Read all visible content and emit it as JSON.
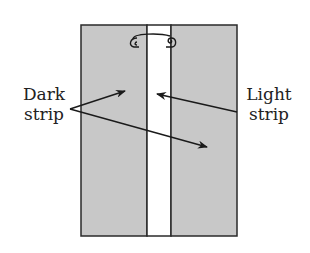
{
  "diagram": {
    "colors": {
      "panel_fill": "#c8c8c8",
      "strip_fill": "#ffffff",
      "outline": "#2a2a2a",
      "text": "#222222"
    },
    "labels": {
      "dark": {
        "line1": "Dark",
        "line2": "strip"
      },
      "light": {
        "line1": "Light",
        "line2": "strip"
      }
    },
    "icons": {
      "pin": "safety-pin-icon"
    }
  }
}
